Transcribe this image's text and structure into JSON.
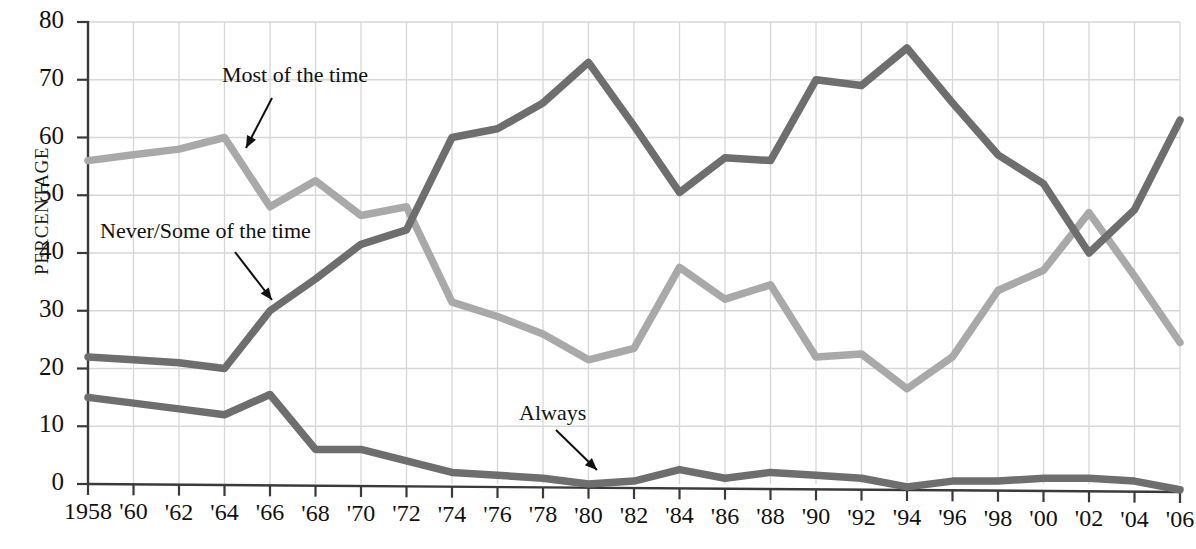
{
  "chart_data": {
    "type": "line",
    "title": "",
    "xlabel": "",
    "ylabel": "PERCENTAGE",
    "ylim": [
      0,
      80
    ],
    "yticks": [
      0,
      10,
      20,
      30,
      40,
      50,
      60,
      70,
      80
    ],
    "grid": true,
    "legend": "annotations-on-plot",
    "x": [
      1958,
      1960,
      1962,
      1964,
      1966,
      1968,
      1970,
      1972,
      1974,
      1976,
      1978,
      1980,
      1982,
      1984,
      1986,
      1988,
      1990,
      1992,
      1994,
      1996,
      1998,
      2000,
      2002,
      2004,
      2006
    ],
    "xtick_labels": [
      "1958",
      "'60",
      "'62",
      "'64",
      "'66",
      "'68",
      "'70",
      "'72",
      "'74",
      "'76",
      "'78",
      "'80",
      "'82",
      "'84",
      "'86",
      "'88",
      "'90",
      "'92",
      "'94",
      "'96",
      "'98",
      "'00",
      "'02",
      "'04",
      "'06"
    ],
    "series": [
      {
        "name": "Most of the time",
        "color": "#a9a9a9",
        "values": [
          56.0,
          57.0,
          58.0,
          60.0,
          48.0,
          52.5,
          46.5,
          48.0,
          31.5,
          29.0,
          26.0,
          21.5,
          23.5,
          37.5,
          32.0,
          34.5,
          22.0,
          22.5,
          16.5,
          22.0,
          33.5,
          37.0,
          47.0,
          36.0,
          24.5
        ]
      },
      {
        "name": "Never/Some of the time",
        "color": "#6e6e6e",
        "values": [
          22.0,
          21.5,
          21.0,
          20.0,
          30.0,
          35.5,
          41.5,
          44.0,
          60.0,
          61.5,
          66.0,
          73.0,
          62.0,
          50.5,
          56.5,
          56.0,
          70.0,
          69.0,
          75.5,
          66.0,
          57.0,
          52.0,
          40.0,
          47.5,
          63.0
        ]
      },
      {
        "name": "Always",
        "color": "#6e6e6e",
        "values": [
          15.0,
          14.0,
          13.0,
          12.0,
          15.5,
          6.0,
          6.0,
          4.0,
          2.0,
          1.5,
          1.0,
          0.0,
          0.5,
          2.5,
          1.0,
          2.0,
          1.5,
          1.0,
          -0.5,
          0.5,
          0.5,
          1.0,
          1.0,
          0.5,
          -1.0
        ]
      }
    ],
    "annotations": [
      {
        "text": "Most of the time",
        "series": "Most of the time"
      },
      {
        "text": "Never/Some of the time",
        "series": "Never/Some of the time"
      },
      {
        "text": "Always",
        "series": "Always"
      }
    ]
  },
  "axis": {
    "y_label": "PERCENTAGE"
  }
}
